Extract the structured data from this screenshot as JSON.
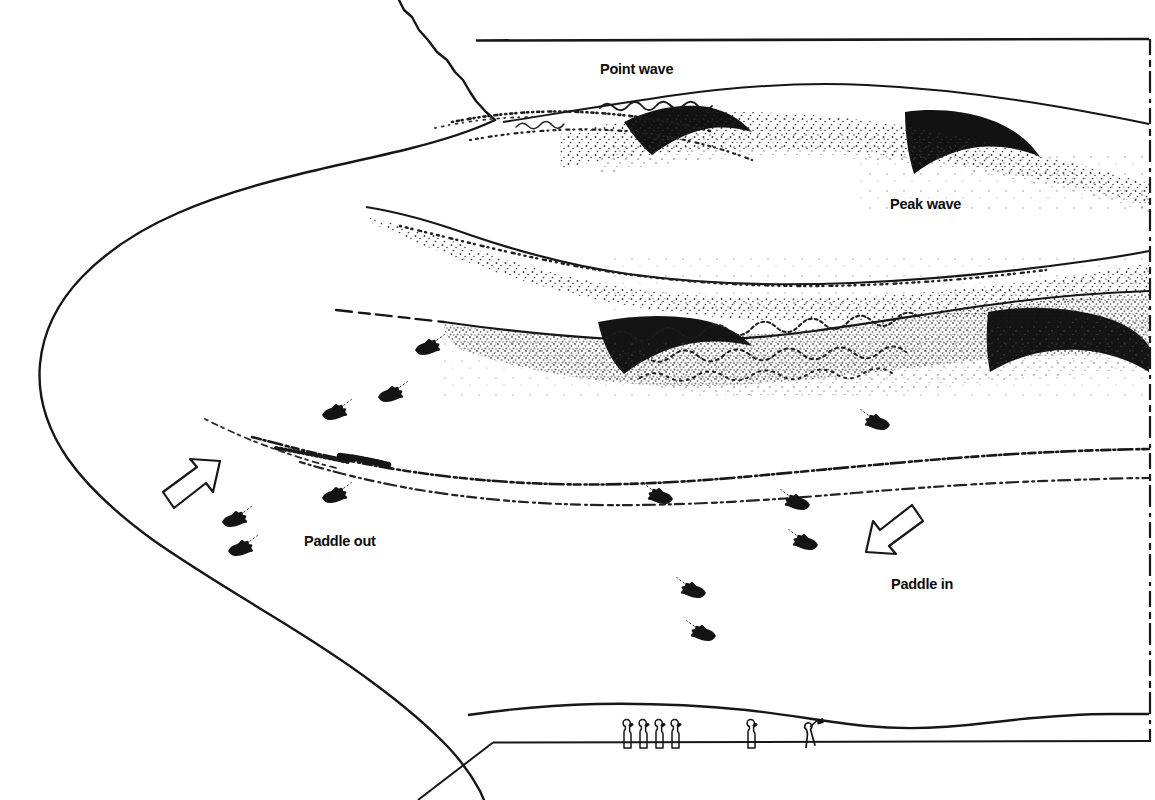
{
  "document": {
    "kind": "halftone line-drawing illustration",
    "subject": "surf contest break diagram"
  },
  "body_text": {
    "lines": [
      "nt is a board, normally",
      "pecifications, with which",
      "es as they approach the",
      "s surfers may be",
      "r of waves. Each",
      "eparately, and the points",
      "totaled to give a final"
    ],
    "full": "nt is a board, normally\npecifications, with which\nes as they approach the\ns surfers may be\nr of waves. Each\neparately, and the points\ntotaled to give a final"
  },
  "diagram": {
    "labels": {
      "point_wave": "Point wave",
      "peak_wave": "Peak wave",
      "paddle_out": "Paddle out",
      "paddle_in": "Paddle in"
    },
    "arrows": [
      {
        "name": "paddle-out-arrow",
        "direction": "up-right",
        "label": "Paddle out"
      },
      {
        "name": "paddle-in-arrow",
        "direction": "down-left",
        "label": "Paddle in"
      }
    ],
    "features": [
      "headland-coastline",
      "point-wave",
      "peak-wave",
      "breaking-whitewater",
      "inshore-foam-line",
      "shoreline",
      "beach"
    ],
    "surfer_count": 14,
    "spectator_count": 6,
    "flag_count": 1,
    "colors": {
      "ink": "#111111",
      "paper": "#ffffff",
      "stipple": "#2b2b2b"
    }
  }
}
